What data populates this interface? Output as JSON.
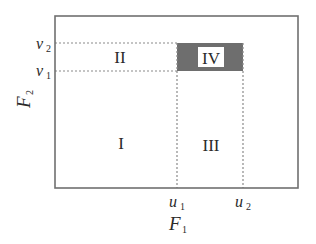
{
  "diagram": {
    "x_axis": {
      "label": "F",
      "label_sub": "1",
      "ticks": [
        {
          "name": "u",
          "sub": "1"
        },
        {
          "name": "u",
          "sub": "2"
        }
      ]
    },
    "y_axis": {
      "label": "F",
      "label_sub": "2",
      "ticks": [
        {
          "name": "v",
          "sub": "2"
        },
        {
          "name": "v",
          "sub": "1"
        }
      ]
    },
    "regions": [
      {
        "id": "I",
        "label": "I"
      },
      {
        "id": "II",
        "label": "II"
      },
      {
        "id": "III",
        "label": "III"
      },
      {
        "id": "IV",
        "label": "IV",
        "shaded": true
      }
    ],
    "colors": {
      "frame": "#707070",
      "dotted": "#8a8a8a",
      "shade": "#6e6e6e",
      "text": "#2a2a2a"
    }
  }
}
